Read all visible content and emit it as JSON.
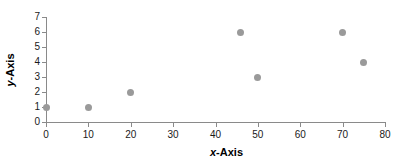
{
  "chart_data": {
    "type": "scatter",
    "title": "",
    "subtitle": "",
    "xlabel": "x-Axis",
    "ylabel": "y-Axis",
    "xlim": [
      0,
      80
    ],
    "ylim": [
      0,
      7
    ],
    "xticks": [
      0,
      10,
      20,
      30,
      40,
      50,
      60,
      70,
      80
    ],
    "yticks": [
      0,
      1,
      2,
      3,
      4,
      5,
      6,
      7
    ],
    "grid": false,
    "legend": false,
    "legend_position": "none",
    "marker_color": "#9a9a9a",
    "marker_shape": "circle",
    "axis_color": "#8a8a8a",
    "background_color": "#ffffff",
    "series": [
      {
        "name": "series-1",
        "points": [
          {
            "x": 0,
            "y": 1
          },
          {
            "x": 10,
            "y": 1
          },
          {
            "x": 20,
            "y": 2
          },
          {
            "x": 46,
            "y": 6
          },
          {
            "x": 50,
            "y": 3
          },
          {
            "x": 70,
            "y": 6
          },
          {
            "x": 75,
            "y": 4
          }
        ]
      }
    ]
  }
}
